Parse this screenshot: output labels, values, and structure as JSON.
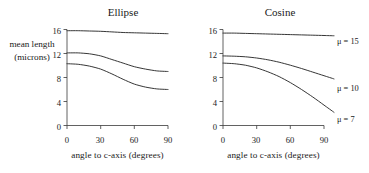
{
  "figure": {
    "ylabel_lines": [
      "mean length",
      "(microns)"
    ]
  },
  "chart_data": [
    {
      "type": "line",
      "title": "Ellipse",
      "xlabel": "angle to c-axis (degrees)",
      "ylabel": "mean length (microns)",
      "xlim": [
        0,
        90
      ],
      "ylim": [
        0,
        16
      ],
      "xticks": [
        0,
        30,
        60,
        90
      ],
      "xtick_labels": [
        "0",
        "30",
        "60",
        "90"
      ],
      "yticks": [
        0,
        4,
        8,
        12,
        16
      ],
      "ytick_labels": [
        "0",
        "4",
        "8",
        "12",
        "16"
      ],
      "grid": false,
      "legend": "none",
      "x": [
        0,
        10,
        20,
        30,
        40,
        50,
        60,
        70,
        80,
        90
      ],
      "series": [
        {
          "name": "mu = 15",
          "values": [
            15.8,
            15.8,
            15.75,
            15.7,
            15.6,
            15.5,
            15.45,
            15.4,
            15.35,
            15.3
          ]
        },
        {
          "name": "mu = 10",
          "values": [
            12.1,
            12.1,
            11.95,
            11.6,
            11.0,
            10.4,
            9.8,
            9.4,
            9.1,
            9.0
          ]
        },
        {
          "name": "mu = 7",
          "values": [
            10.3,
            10.2,
            9.9,
            9.4,
            8.6,
            7.7,
            6.9,
            6.4,
            6.1,
            6.0
          ]
        }
      ]
    },
    {
      "type": "line",
      "title": "Cosine",
      "xlabel": "angle to c-axis (degrees)",
      "ylabel": "mean length (microns)",
      "xlim": [
        0,
        90
      ],
      "ylim": [
        0,
        16
      ],
      "xticks": [
        0,
        30,
        60,
        90
      ],
      "xtick_labels": [
        "0",
        "30",
        "60",
        "90"
      ],
      "yticks": [
        0,
        4,
        8,
        12,
        16
      ],
      "ytick_labels": [
        "0",
        "4",
        "8",
        "12",
        "16"
      ],
      "grid": false,
      "legend": "right-inline",
      "x": [
        0,
        10,
        20,
        30,
        40,
        50,
        60,
        70,
        80,
        90
      ],
      "series": [
        {
          "name": "mu = 15",
          "label": "μ = 15",
          "values": [
            15.4,
            15.4,
            15.35,
            15.3,
            15.25,
            15.2,
            15.15,
            15.1,
            15.05,
            15.0
          ]
        },
        {
          "name": "mu = 10",
          "label": "μ = 10",
          "values": [
            11.6,
            11.55,
            11.45,
            11.25,
            10.95,
            10.55,
            10.05,
            9.5,
            8.9,
            8.3
          ]
        },
        {
          "name": "mu = 7",
          "label": "μ = 7",
          "values": [
            10.4,
            10.3,
            10.05,
            9.6,
            8.95,
            8.15,
            7.15,
            6.0,
            4.75,
            3.4
          ]
        }
      ]
    }
  ],
  "left_panel": {
    "title": "Ellipse",
    "xlabel": "angle to c-axis (degrees)",
    "ytick_labels": [
      "16",
      "12",
      "8",
      "4",
      "0"
    ],
    "xtick_labels": [
      "0",
      "30",
      "60",
      "90"
    ]
  },
  "right_panel": {
    "title": "Cosine",
    "xlabel": "angle to c-axis (degrees)",
    "ytick_labels": [
      "16",
      "12",
      "8",
      "4",
      "0"
    ],
    "xtick_labels": [
      "0",
      "30",
      "60",
      "90"
    ],
    "curve_labels": [
      "μ = 15",
      "μ = 10",
      "μ = 7"
    ]
  }
}
